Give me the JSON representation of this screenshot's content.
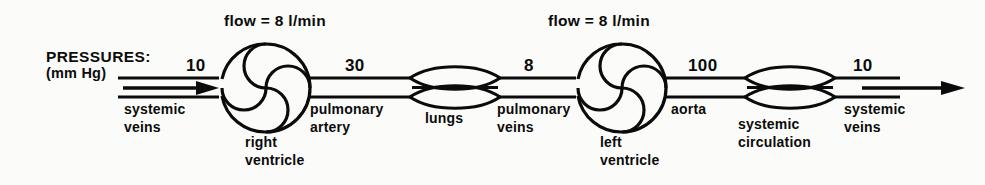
{
  "diagram": {
    "title_lines": {
      "pressures": "PRESSURES:",
      "units": "(mm Hg)"
    },
    "flow_labels": [
      {
        "text": "flow = 8 l/min"
      },
      {
        "text": "flow = 8 l/min"
      }
    ],
    "pressure_values": [
      {
        "value": "10",
        "for": "systemic veins (right heart inflow)"
      },
      {
        "value": "30",
        "for": "pulmonary artery"
      },
      {
        "value": "8",
        "for": "pulmonary veins"
      },
      {
        "value": "100",
        "for": "aorta"
      },
      {
        "value": "10",
        "for": "systemic veins (outflow)"
      }
    ],
    "vessel_labels": [
      {
        "line1": "systemic",
        "line2": "veins"
      },
      {
        "line1": "pulmonary",
        "line2": "artery"
      },
      {
        "line1": "pulmonary",
        "line2": "veins"
      },
      {
        "line1": "aorta",
        "line2": ""
      },
      {
        "line1": "systemic",
        "line2": "veins"
      }
    ],
    "organ_labels": [
      {
        "line1": "right",
        "line2": "ventricle"
      },
      {
        "line1": "lungs",
        "line2": ""
      },
      {
        "line1": "left",
        "line2": "ventricle"
      },
      {
        "line1": "systemic",
        "line2": "circulation"
      }
    ],
    "colors": {
      "ink": "#0b0b0b",
      "background": "#fbfbf9"
    },
    "icons": {
      "ventricle": "pinwheel-pump-icon",
      "capillary_bed": "lens-capillary-icon",
      "flow_arrow": "arrow-right-icon"
    }
  }
}
